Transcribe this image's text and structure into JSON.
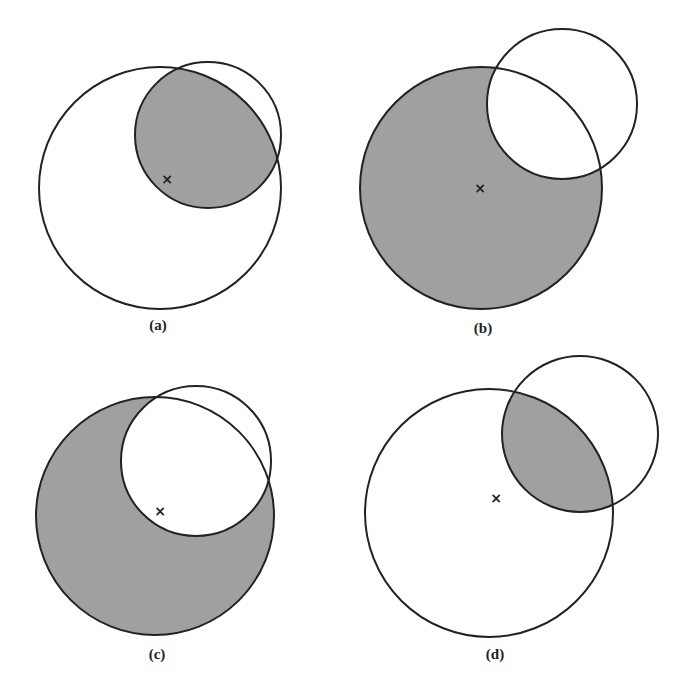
{
  "diagram": {
    "style": {
      "shade": "#a0a0a0",
      "stroke": "#222222",
      "background": "#ffffff"
    },
    "center_marker": "×",
    "panels": [
      {
        "id": "a",
        "label": "(a)",
        "shaded": "intersection",
        "big": {
          "cx": 160,
          "cy": 188,
          "r": 121
        },
        "small": {
          "cx": 208,
          "cy": 135,
          "r": 73
        },
        "marker": {
          "x": 167,
          "y": 179
        },
        "label_pos": {
          "x": 158,
          "y": 330
        }
      },
      {
        "id": "b",
        "label": "(b)",
        "shaded": "big-minus-small",
        "big": {
          "cx": 481,
          "cy": 188,
          "r": 121
        },
        "small": {
          "cx": 562,
          "cy": 104,
          "r": 75
        },
        "marker": {
          "x": 480,
          "y": 188
        },
        "label_pos": {
          "x": 483,
          "y": 333
        }
      },
      {
        "id": "c",
        "label": "(c)",
        "shaded": "big-minus-small",
        "big": {
          "cx": 155,
          "cy": 516,
          "r": 119
        },
        "small": {
          "cx": 196,
          "cy": 461,
          "r": 75
        },
        "marker": {
          "x": 160,
          "y": 511
        },
        "label_pos": {
          "x": 157,
          "y": 659
        }
      },
      {
        "id": "d",
        "label": "(d)",
        "shaded": "intersection",
        "big": {
          "cx": 489,
          "cy": 513,
          "r": 124
        },
        "small": {
          "cx": 580,
          "cy": 434,
          "r": 78
        },
        "marker": {
          "x": 496,
          "y": 498
        },
        "label_pos": {
          "x": 495,
          "y": 659
        }
      }
    ]
  }
}
